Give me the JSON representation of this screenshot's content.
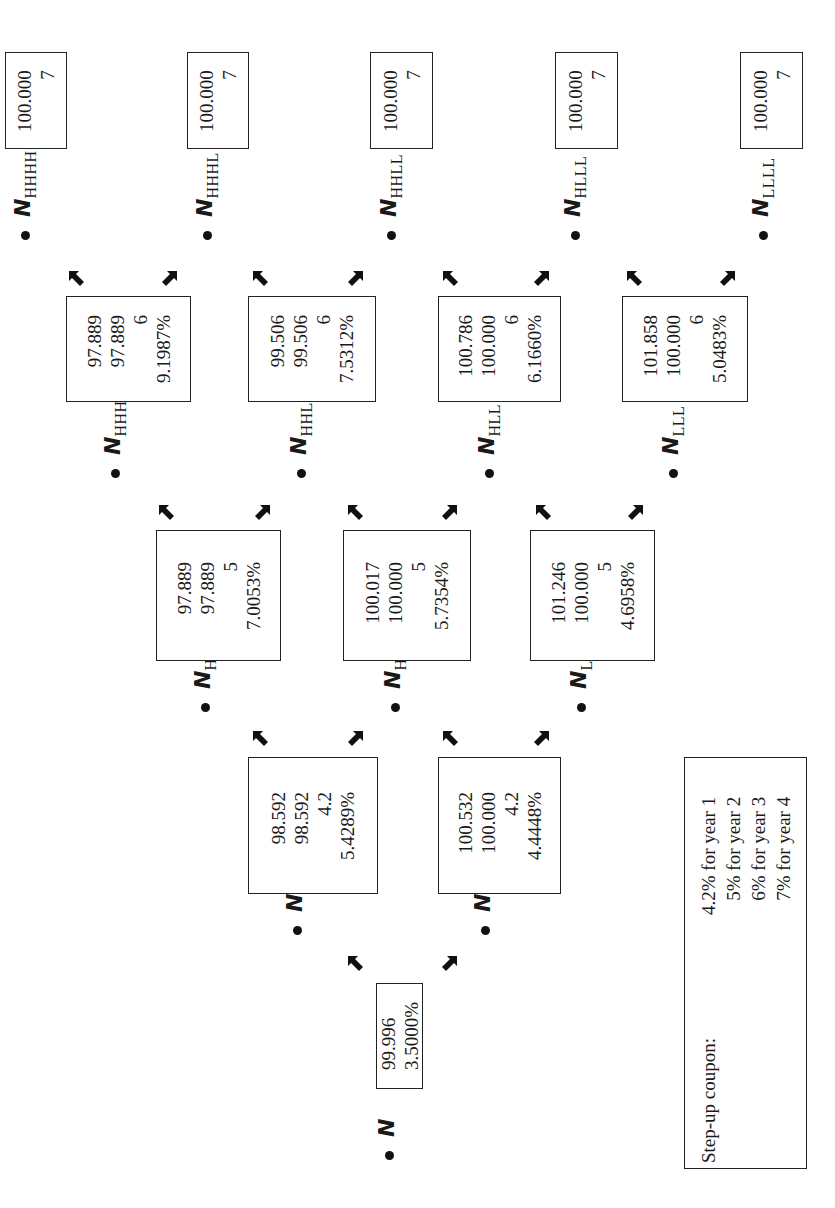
{
  "diagram": {
    "type": "binomial-tree",
    "orientation": "rotated-90-ccw",
    "nodes": [
      {
        "id": "N",
        "label": "N",
        "sub": "",
        "values": [
          "99.996",
          "3.5000%"
        ]
      },
      {
        "id": "NH",
        "label": "N",
        "sub": "H",
        "values": [
          "98.592",
          "98.592",
          "4.2",
          "5.4289%"
        ]
      },
      {
        "id": "NL",
        "label": "N",
        "sub": "L",
        "values": [
          "100.532",
          "100.000",
          "4.2",
          "4.4448%"
        ]
      },
      {
        "id": "NHH",
        "label": "N",
        "sub": "HH",
        "values": [
          "97.889",
          "97.889",
          "5",
          "7.0053%"
        ]
      },
      {
        "id": "NHL",
        "label": "N",
        "sub": "HL",
        "values": [
          "100.017",
          "100.000",
          "5",
          "5.7354%"
        ]
      },
      {
        "id": "NLL",
        "label": "N",
        "sub": "LL",
        "values": [
          "101.246",
          "100.000",
          "5",
          "4.6958%"
        ]
      },
      {
        "id": "NHHH",
        "label": "N",
        "sub": "HHH",
        "values": [
          "97.889",
          "97.889",
          "6",
          "9.1987%"
        ]
      },
      {
        "id": "NHHL",
        "label": "N",
        "sub": "HHL",
        "values": [
          "99.506",
          "99.506",
          "6",
          "7.5312%"
        ]
      },
      {
        "id": "NHLL",
        "label": "N",
        "sub": "HLL",
        "values": [
          "100.786",
          "100.000",
          "6",
          "6.1660%"
        ]
      },
      {
        "id": "NLLL",
        "label": "N",
        "sub": "LLL",
        "values": [
          "101.858",
          "100.000",
          "6",
          "5.0483%"
        ]
      },
      {
        "id": "NHHHH",
        "label": "N",
        "sub": "HHHH",
        "values": [
          "100.000",
          "7"
        ]
      },
      {
        "id": "NHHHL",
        "label": "N",
        "sub": "HHHL",
        "values": [
          "100.000",
          "7"
        ]
      },
      {
        "id": "NHHLL",
        "label": "N",
        "sub": "HHLL",
        "values": [
          "100.000",
          "7"
        ]
      },
      {
        "id": "NHLLL",
        "label": "N",
        "sub": "HLLL",
        "values": [
          "100.000",
          "7"
        ]
      },
      {
        "id": "NLLLL",
        "label": "N",
        "sub": "LLLL",
        "values": [
          "100.000",
          "7"
        ]
      }
    ],
    "legend": {
      "title": "Step-up coupon:",
      "rows": [
        "4.2% for year 1",
        "5% for year 2",
        "6% for year 3",
        "7% for year 4"
      ]
    },
    "colors": {
      "line": "#222222",
      "text": "#1a1a1a",
      "background": "#ffffff"
    }
  }
}
